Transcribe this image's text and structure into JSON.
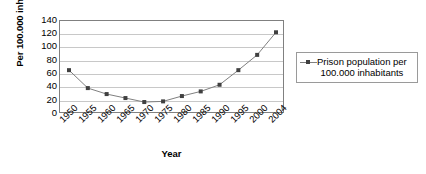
{
  "chart_data": {
    "type": "line",
    "title": "",
    "xlabel": "Year",
    "ylabel": "Per 100.000 inhabitants",
    "categories": [
      "1950",
      "1955",
      "1960",
      "1965",
      "1970",
      "1975",
      "1980",
      "1985",
      "1990",
      "1995",
      "2000",
      "2004"
    ],
    "values": [
      66,
      39,
      30,
      24,
      18,
      19,
      27,
      34,
      44,
      66,
      89,
      123
    ],
    "series": [
      {
        "name": "Prison population per 100.000 inhabitants",
        "values": [
          66,
          39,
          30,
          24,
          18,
          19,
          27,
          34,
          44,
          66,
          89,
          123
        ]
      }
    ],
    "ylim": [
      0,
      140
    ],
    "ytick_step": 20,
    "yticks": [
      140,
      120,
      100,
      80,
      60,
      40,
      20,
      0
    ],
    "grid": true,
    "legend_position": "right",
    "marker": "square",
    "line_color": "#808080",
    "marker_color": "#404040",
    "grid_color": "#c8c8c8",
    "axis_color": "#808080"
  },
  "axis": {
    "y_title": "Per 100.000 inhabitants",
    "x_title": "Year"
  },
  "legend": {
    "entries": [
      {
        "line1": "Prison population per",
        "line2": "100.000 inhabitants",
        "marker": "square-line-marker"
      }
    ]
  }
}
